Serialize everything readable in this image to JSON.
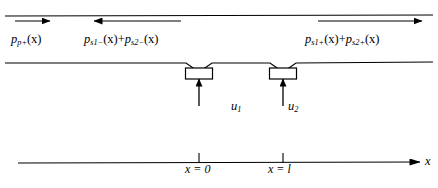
{
  "figure": {
    "type": "acoustic-duct-diagram",
    "background_color": "#ffffff",
    "line_color": "#000000"
  },
  "labels": {
    "primary_wave": {
      "text": "p",
      "sub": "p+",
      "arg": "(x)",
      "full": "p_p+(x)",
      "direction": "right"
    },
    "secondary_negative": {
      "term1_sym": "p",
      "term1_sub": "s1−",
      "term1_arg": "(x)",
      "plus": "+",
      "term2_sym": "p",
      "term2_sub": "s2−",
      "term2_arg": "(x)",
      "full": "p_s1−(x) + p_s2−(x)",
      "direction": "left"
    },
    "secondary_positive": {
      "term1_sym": "p",
      "term1_sub": "s1+",
      "term1_arg": "(x)",
      "plus": "+",
      "term2_sym": "p",
      "term2_sub": "s2+",
      "term2_arg": "(x)",
      "full": "p_s1+(x) + p_s2+(x)",
      "direction": "right"
    },
    "source1_velocity": {
      "sym": "u",
      "sub": "1",
      "full": "u₁"
    },
    "source2_velocity": {
      "sym": "u",
      "sub": "2",
      "full": "u₂"
    },
    "tick_origin": {
      "var": "x",
      "eq": "=",
      "value": "0",
      "full": "x = 0"
    },
    "tick_length": {
      "var": "x",
      "eq": "=",
      "value": "l",
      "full": "x = l"
    },
    "axis_name": "x"
  },
  "geometry": {
    "duct_top_wall_y": 16,
    "duct_bottom_wall_y": 63,
    "axis_y": 163,
    "source1_x": 199,
    "source2_x": 283,
    "source_box_width": 27,
    "source_box_height": 11
  }
}
